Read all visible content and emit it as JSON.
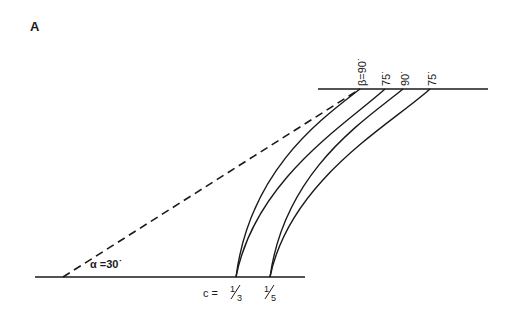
{
  "figure": {
    "panel_label": "A",
    "top_labels": [
      {
        "text": "β=90˙",
        "x": 362
      },
      {
        "text": "75˙",
        "x": 386
      },
      {
        "text": "90˙",
        "x": 405
      },
      {
        "text": "75˙",
        "x": 432
      }
    ],
    "alpha_label": "α =30˙",
    "c_label": "c =",
    "c_values": [
      "1/3",
      "1/5"
    ],
    "c_value_1_num": "1",
    "c_value_1_den": "3",
    "c_value_2_num": "1",
    "c_value_2_den": "5",
    "colors": {
      "ink": "#1a1a1a",
      "background": "#ffffff"
    }
  }
}
